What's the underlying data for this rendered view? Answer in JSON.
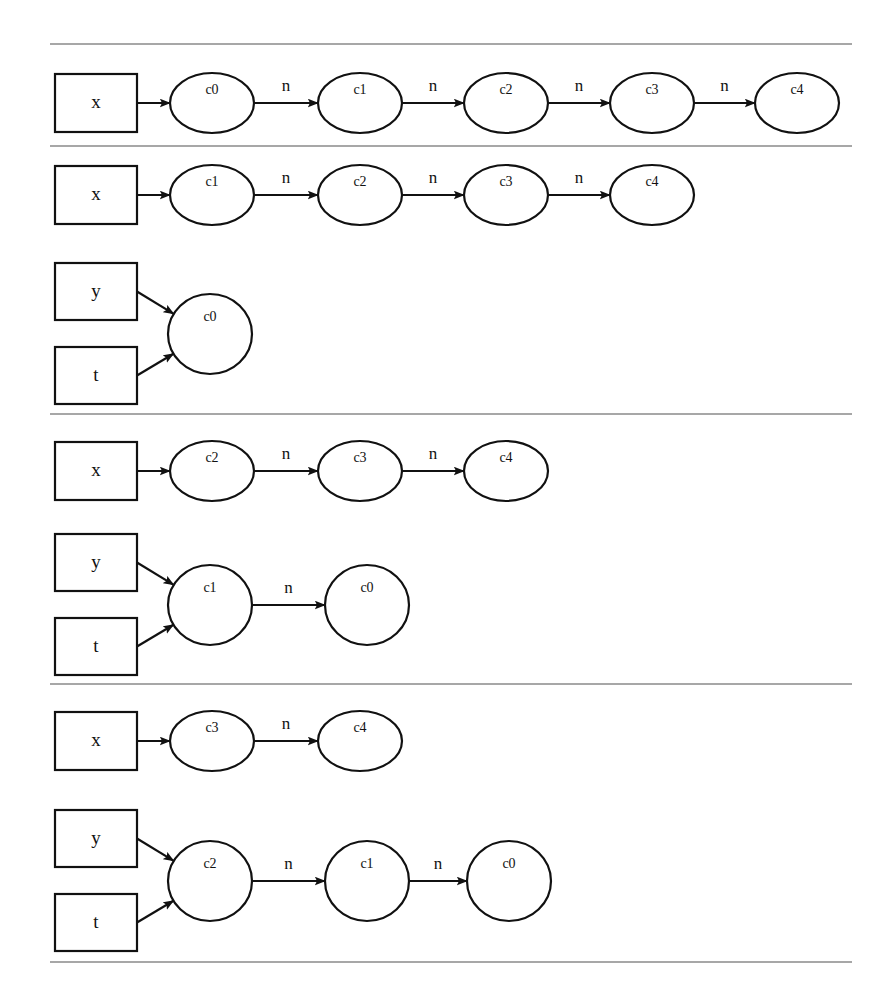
{
  "figure": {
    "kind": "linked-list-pointer-trace",
    "background_color": "#ffffff",
    "ink_color": "#111111",
    "rule_color": "#8a8a8a",
    "edge_label_default": "n",
    "pointer_names": [
      "x",
      "y",
      "t"
    ],
    "cell_names": [
      "c0",
      "c1",
      "c2",
      "c3",
      "c4"
    ]
  },
  "rules": [
    {
      "name": "rule-top",
      "y": 44,
      "x1": 50,
      "x2": 852
    },
    {
      "name": "rule-1",
      "y": 146,
      "x1": 50,
      "x2": 852
    },
    {
      "name": "rule-2",
      "y": 414,
      "x1": 50,
      "x2": 852
    },
    {
      "name": "rule-3",
      "y": 684,
      "x1": 50,
      "x2": 852
    },
    {
      "name": "rule-bottom",
      "y": 962,
      "x1": 50,
      "x2": 852
    }
  ],
  "sections": [
    {
      "id": "section-1",
      "rows": [
        {
          "id": "row-x-c0-c4",
          "pointers": [
            {
              "label": "x",
              "box": {
                "x": 55,
                "y": 74,
                "w": 82,
                "h": 58
              },
              "arrow_to_node": 0
            }
          ],
          "nodes": [
            {
              "label": "c0",
              "cx": 212,
              "cy": 103,
              "rx": 42,
              "ry": 30
            },
            {
              "label": "c1",
              "cx": 360,
              "cy": 103,
              "rx": 42,
              "ry": 30
            },
            {
              "label": "c2",
              "cx": 506,
              "cy": 103,
              "rx": 42,
              "ry": 30
            },
            {
              "label": "c3",
              "cx": 652,
              "cy": 103,
              "rx": 42,
              "ry": 30
            },
            {
              "label": "c4",
              "cx": 797,
              "cy": 103,
              "rx": 42,
              "ry": 30
            }
          ],
          "edges": [
            {
              "from": 0,
              "to": 1,
              "label": "n"
            },
            {
              "from": 1,
              "to": 2,
              "label": "n"
            },
            {
              "from": 2,
              "to": 3,
              "label": "n"
            },
            {
              "from": 3,
              "to": 4,
              "label": "n"
            }
          ]
        },
        {
          "id": "row-x-c1-c4",
          "pointers": [
            {
              "label": "x",
              "box": {
                "x": 55,
                "y": 166,
                "w": 82,
                "h": 58
              },
              "arrow_to_node": 0
            }
          ],
          "nodes": [
            {
              "label": "c1",
              "cx": 212,
              "cy": 195,
              "rx": 42,
              "ry": 30
            },
            {
              "label": "c2",
              "cx": 360,
              "cy": 195,
              "rx": 42,
              "ry": 30
            },
            {
              "label": "c3",
              "cx": 506,
              "cy": 195,
              "rx": 42,
              "ry": 30
            },
            {
              "label": "c4",
              "cx": 652,
              "cy": 195,
              "rx": 42,
              "ry": 30
            }
          ],
          "edges": [
            {
              "from": 0,
              "to": 1,
              "label": "n"
            },
            {
              "from": 1,
              "to": 2,
              "label": "n"
            },
            {
              "from": 2,
              "to": 3,
              "label": "n"
            }
          ]
        },
        {
          "id": "row-yt-c0",
          "pointers": [
            {
              "label": "y",
              "box": {
                "x": 55,
                "y": 263,
                "w": 82,
                "h": 57
              },
              "arrow_to_node": 0
            },
            {
              "label": "t",
              "box": {
                "x": 55,
                "y": 347,
                "w": 82,
                "h": 57
              },
              "arrow_to_node": 0
            }
          ],
          "nodes": [
            {
              "label": "c0",
              "cx": 210,
              "cy": 334,
              "rx": 42,
              "ry": 40
            }
          ],
          "edges": []
        }
      ]
    },
    {
      "id": "section-2",
      "rows": [
        {
          "id": "row-x-c2-c4",
          "pointers": [
            {
              "label": "x",
              "box": {
                "x": 55,
                "y": 442,
                "w": 82,
                "h": 58
              },
              "arrow_to_node": 0
            }
          ],
          "nodes": [
            {
              "label": "c2",
              "cx": 212,
              "cy": 471,
              "rx": 42,
              "ry": 30
            },
            {
              "label": "c3",
              "cx": 360,
              "cy": 471,
              "rx": 42,
              "ry": 30
            },
            {
              "label": "c4",
              "cx": 506,
              "cy": 471,
              "rx": 42,
              "ry": 30
            }
          ],
          "edges": [
            {
              "from": 0,
              "to": 1,
              "label": "n"
            },
            {
              "from": 1,
              "to": 2,
              "label": "n"
            }
          ]
        },
        {
          "id": "row-yt-c1-c0",
          "pointers": [
            {
              "label": "y",
              "box": {
                "x": 55,
                "y": 534,
                "w": 82,
                "h": 57
              },
              "arrow_to_node": 0
            },
            {
              "label": "t",
              "box": {
                "x": 55,
                "y": 618,
                "w": 82,
                "h": 57
              },
              "arrow_to_node": 0
            }
          ],
          "nodes": [
            {
              "label": "c1",
              "cx": 210,
              "cy": 605,
              "rx": 42,
              "ry": 40
            },
            {
              "label": "c0",
              "cx": 367,
              "cy": 605,
              "rx": 42,
              "ry": 40
            }
          ],
          "edges": [
            {
              "from": 0,
              "to": 1,
              "label": "n"
            }
          ]
        }
      ]
    },
    {
      "id": "section-3",
      "rows": [
        {
          "id": "row-x-c3-c4",
          "pointers": [
            {
              "label": "x",
              "box": {
                "x": 55,
                "y": 712,
                "w": 82,
                "h": 58
              },
              "arrow_to_node": 0
            }
          ],
          "nodes": [
            {
              "label": "c3",
              "cx": 212,
              "cy": 741,
              "rx": 42,
              "ry": 30
            },
            {
              "label": "c4",
              "cx": 360,
              "cy": 741,
              "rx": 42,
              "ry": 30
            }
          ],
          "edges": [
            {
              "from": 0,
              "to": 1,
              "label": "n"
            }
          ]
        },
        {
          "id": "row-yt-c2-c1-c0",
          "pointers": [
            {
              "label": "y",
              "box": {
                "x": 55,
                "y": 810,
                "w": 82,
                "h": 57
              },
              "arrow_to_node": 0
            },
            {
              "label": "t",
              "box": {
                "x": 55,
                "y": 894,
                "w": 82,
                "h": 57
              },
              "arrow_to_node": 0
            }
          ],
          "nodes": [
            {
              "label": "c2",
              "cx": 210,
              "cy": 881,
              "rx": 42,
              "ry": 40
            },
            {
              "label": "c1",
              "cx": 367,
              "cy": 881,
              "rx": 42,
              "ry": 40
            },
            {
              "label": "c0",
              "cx": 509,
              "cy": 881,
              "rx": 42,
              "ry": 40
            }
          ],
          "edges": [
            {
              "from": 0,
              "to": 1,
              "label": "n"
            },
            {
              "from": 1,
              "to": 2,
              "label": "n"
            }
          ]
        }
      ]
    }
  ]
}
